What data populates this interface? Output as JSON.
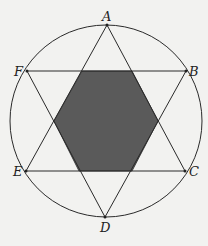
{
  "diagram": {
    "points": [
      "A",
      "B",
      "C",
      "D",
      "E",
      "F"
    ],
    "triangles": [
      [
        "A",
        "C",
        "E"
      ],
      [
        "B",
        "D",
        "F"
      ]
    ],
    "shaded_region": "central hexagon",
    "colors": {
      "line": "#2a2a2a",
      "shade": "#5a5a5a",
      "background": "#f2f2f0"
    }
  }
}
